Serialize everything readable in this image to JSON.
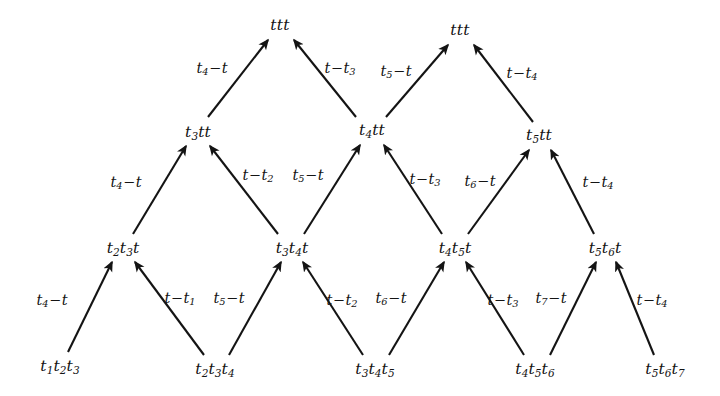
{
  "figure": {
    "type": "lattice-transition-diagram",
    "background_color": "#ffffff",
    "stroke_color": "#141414",
    "width": 720,
    "height": 396,
    "rows": 4
  },
  "nodes": [
    {
      "id": "n-top-left",
      "text": "ttt",
      "row": 0,
      "x": 280,
      "y": 26
    },
    {
      "id": "n-top-right",
      "text": "ttt",
      "row": 0,
      "x": 460,
      "y": 31
    },
    {
      "id": "n-r1-a",
      "text": "t3tt",
      "row": 1,
      "x": 198,
      "y": 133
    },
    {
      "id": "n-r1-b",
      "text": "t4tt",
      "row": 1,
      "x": 372,
      "y": 131
    },
    {
      "id": "n-r1-c",
      "text": "t5tt",
      "row": 1,
      "x": 539,
      "y": 136
    },
    {
      "id": "n-r2-a",
      "text": "t2t3t",
      "row": 2,
      "x": 123,
      "y": 249
    },
    {
      "id": "n-r2-b",
      "text": "t3t4t",
      "row": 2,
      "x": 292,
      "y": 249
    },
    {
      "id": "n-r2-c",
      "text": "t4t5t",
      "row": 2,
      "x": 455,
      "y": 249
    },
    {
      "id": "n-r2-d",
      "text": "t5t6t",
      "row": 2,
      "x": 605,
      "y": 249
    },
    {
      "id": "n-r3-a",
      "text": "t1t2t3",
      "row": 3,
      "x": 60,
      "y": 367
    },
    {
      "id": "n-r3-b",
      "text": "t2t3t4",
      "row": 3,
      "x": 215,
      "y": 370
    },
    {
      "id": "n-r3-c",
      "text": "t3t4t5",
      "row": 3,
      "x": 375,
      "y": 370
    },
    {
      "id": "n-r3-d",
      "text": "t4t5t6",
      "row": 3,
      "x": 535,
      "y": 370
    },
    {
      "id": "n-r3-e",
      "text": "t5t6t7",
      "row": 3,
      "x": 665,
      "y": 370
    }
  ],
  "node_text": {
    "ttt": {
      "base": "ttt"
    },
    "t3tt": {
      "base": "t",
      "sub": "3",
      "tail": "tt"
    },
    "t4tt": {
      "base": "t",
      "sub": "4",
      "tail": "tt"
    },
    "t5tt": {
      "base": "t",
      "sub": "5",
      "tail": "tt"
    }
  },
  "edges": [
    {
      "id": "e-01",
      "from": "n-r1-a",
      "to": "n-top-left",
      "x1": 208,
      "y1": 117,
      "x2": 268,
      "y2": 40,
      "label": {
        "lead": "t",
        "sub": "4",
        "op": "−",
        "trail": "t"
      },
      "lx": 212,
      "ly": 69
    },
    {
      "id": "e-02",
      "from": "n-r1-b",
      "to": "n-top-left",
      "x1": 356,
      "y1": 117,
      "x2": 294,
      "y2": 40,
      "label": {
        "lead": "t",
        "op": "−",
        "trail": "t",
        "trail_sub": "3"
      },
      "lx": 340,
      "ly": 69
    },
    {
      "id": "e-03",
      "from": "n-r1-b",
      "to": "n-top-right",
      "x1": 386,
      "y1": 117,
      "x2": 448,
      "y2": 45,
      "label": {
        "lead": "t",
        "sub": "5",
        "op": "−",
        "trail": "t"
      },
      "lx": 396,
      "ly": 72
    },
    {
      "id": "e-04",
      "from": "n-r1-c",
      "to": "n-top-right",
      "x1": 533,
      "y1": 122,
      "x2": 474,
      "y2": 45,
      "label": {
        "lead": "t",
        "op": "−",
        "trail": "t",
        "trail_sub": "4"
      },
      "lx": 522,
      "ly": 74
    },
    {
      "id": "e-05",
      "from": "n-r2-a",
      "to": "n-r1-a",
      "x1": 133,
      "y1": 234,
      "x2": 186,
      "y2": 146,
      "label": {
        "lead": "t",
        "sub": "4",
        "op": "−",
        "trail": "t"
      },
      "lx": 126,
      "ly": 183
    },
    {
      "id": "e-06",
      "from": "n-r2-b",
      "to": "n-r1-a",
      "x1": 278,
      "y1": 234,
      "x2": 210,
      "y2": 146,
      "label": {
        "lead": "t",
        "op": "−",
        "trail": "t",
        "trail_sub": "2"
      },
      "lx": 258,
      "ly": 176
    },
    {
      "id": "e-07",
      "from": "n-r2-b",
      "to": "n-r1-b",
      "x1": 304,
      "y1": 234,
      "x2": 360,
      "y2": 145,
      "label": {
        "lead": "t",
        "sub": "5",
        "op": "−",
        "trail": "t"
      },
      "lx": 308,
      "ly": 176
    },
    {
      "id": "e-08",
      "from": "n-r2-c",
      "to": "n-r1-b",
      "x1": 442,
      "y1": 234,
      "x2": 384,
      "y2": 145,
      "label": {
        "lead": "t",
        "op": "−",
        "trail": "t",
        "trail_sub": "3"
      },
      "lx": 425,
      "ly": 180
    },
    {
      "id": "e-09",
      "from": "n-r2-c",
      "to": "n-r1-c",
      "x1": 468,
      "y1": 234,
      "x2": 529,
      "y2": 150,
      "label": {
        "lead": "t",
        "sub": "6",
        "op": "−",
        "trail": "t"
      },
      "lx": 480,
      "ly": 182
    },
    {
      "id": "e-10",
      "from": "n-r2-d",
      "to": "n-r1-c",
      "x1": 594,
      "y1": 234,
      "x2": 551,
      "y2": 150,
      "label": {
        "lead": "t",
        "op": "−",
        "trail": "t",
        "trail_sub": "4"
      },
      "lx": 598,
      "ly": 183
    },
    {
      "id": "e-11",
      "from": "n-r3-a",
      "to": "n-r2-a",
      "x1": 68,
      "y1": 352,
      "x2": 112,
      "y2": 262,
      "label": {
        "lead": "t",
        "sub": "4",
        "op": "−",
        "trail": "t"
      },
      "lx": 52,
      "ly": 301
    },
    {
      "id": "e-12",
      "from": "n-r3-b",
      "to": "n-r2-a",
      "x1": 204,
      "y1": 355,
      "x2": 135,
      "y2": 262,
      "label": {
        "lead": "t",
        "op": "−",
        "trail": "t",
        "trail_sub": "1"
      },
      "lx": 180,
      "ly": 299
    },
    {
      "id": "e-13",
      "from": "n-r3-b",
      "to": "n-r2-b",
      "x1": 229,
      "y1": 355,
      "x2": 281,
      "y2": 262,
      "label": {
        "lead": "t",
        "sub": "5",
        "op": "−",
        "trail": "t"
      },
      "lx": 229,
      "ly": 299
    },
    {
      "id": "e-14",
      "from": "n-r3-c",
      "to": "n-r2-b",
      "x1": 363,
      "y1": 355,
      "x2": 303,
      "y2": 262,
      "label": {
        "lead": "t",
        "op": "−",
        "trail": "t",
        "trail_sub": "2"
      },
      "lx": 342,
      "ly": 301
    },
    {
      "id": "e-15",
      "from": "n-r3-c",
      "to": "n-r2-c",
      "x1": 389,
      "y1": 355,
      "x2": 444,
      "y2": 262,
      "label": {
        "lead": "t",
        "sub": "6",
        "op": "−",
        "trail": "t"
      },
      "lx": 391,
      "ly": 299
    },
    {
      "id": "e-16",
      "from": "n-r3-d",
      "to": "n-r2-c",
      "x1": 524,
      "y1": 355,
      "x2": 466,
      "y2": 262,
      "label": {
        "lead": "t",
        "op": "−",
        "trail": "t",
        "trail_sub": "3"
      },
      "lx": 503,
      "ly": 301
    },
    {
      "id": "e-17",
      "from": "n-r3-d",
      "to": "n-r2-d",
      "x1": 550,
      "y1": 355,
      "x2": 596,
      "y2": 262,
      "label": {
        "lead": "t",
        "sub": "7",
        "op": "−",
        "trail": "t"
      },
      "lx": 551,
      "ly": 299
    },
    {
      "id": "e-18",
      "from": "n-r3-e",
      "to": "n-r2-d",
      "x1": 654,
      "y1": 355,
      "x2": 616,
      "y2": 262,
      "label": {
        "lead": "t",
        "op": "−",
        "trail": "t",
        "trail_sub": "4"
      },
      "lx": 652,
      "ly": 301
    }
  ]
}
